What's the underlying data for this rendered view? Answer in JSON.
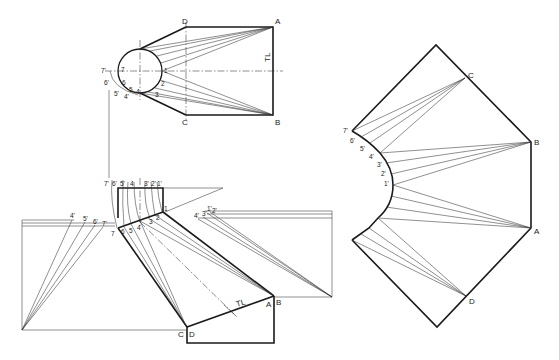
{
  "figure": {
    "top_view": {
      "corner_labels": {
        "A": "A",
        "B": "B",
        "C": "C",
        "D": "D"
      },
      "circle_points": [
        "1",
        "2",
        "3",
        "4",
        "5",
        "6",
        "7"
      ],
      "arc_points": [
        "4'",
        "5'",
        "6'",
        "7'"
      ],
      "tl_label": "TL"
    },
    "front_view": {
      "top_labels": [
        "7'",
        "6'",
        "5'",
        "4",
        "3'",
        "2'",
        "1'"
      ],
      "joint_labels": [
        "7",
        "6",
        "5",
        "4",
        "3",
        "2",
        "1"
      ],
      "left_tl_labels": [
        "4'",
        "5'",
        "6'",
        "7'"
      ],
      "right_tl_labels": [
        "4'",
        "3'",
        "1'",
        "2'"
      ],
      "corner_labels": {
        "C": "C",
        "D": "D",
        "A": "A",
        "B": "B"
      },
      "tl_label": "TL"
    },
    "development": {
      "corner_labels": {
        "C": "C",
        "B": "B",
        "A": "A",
        "D": "D"
      },
      "curve_points": [
        "7'",
        "6'",
        "5'",
        "4'",
        "3'",
        "2'",
        "1'"
      ]
    },
    "colors": {
      "line": "#1a1a1a",
      "background": "#ffffff"
    }
  }
}
